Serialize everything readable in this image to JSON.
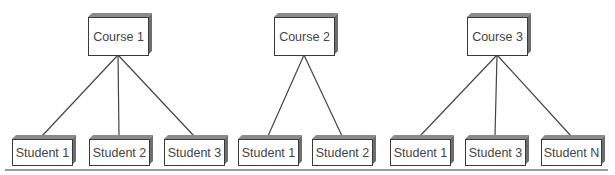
{
  "diagram": {
    "type": "hierarchy",
    "colors": {
      "line": "#444444",
      "box_fill": "#ffffff",
      "box_border": "#3a3a3a",
      "box_shadow": "#6e6e6e",
      "text": "#444444"
    },
    "groups": [
      {
        "course": {
          "label": "Course 1",
          "x": 88,
          "y": 17,
          "w": 60,
          "h": 38
        },
        "students": [
          {
            "label": "Student 1",
            "x": 12,
            "y": 139,
            "w": 60,
            "h": 26
          },
          {
            "label": "Student 2",
            "x": 89,
            "y": 139,
            "w": 60,
            "h": 26
          },
          {
            "label": "Student 3",
            "x": 164,
            "y": 139,
            "w": 60,
            "h": 26
          }
        ]
      },
      {
        "course": {
          "label": "Course 2",
          "x": 274,
          "y": 17,
          "w": 60,
          "h": 38
        },
        "students": [
          {
            "label": "Student 1",
            "x": 238,
            "y": 139,
            "w": 60,
            "h": 26
          },
          {
            "label": "Student 2",
            "x": 312,
            "y": 139,
            "w": 60,
            "h": 26
          }
        ]
      },
      {
        "course": {
          "label": "Course 3",
          "x": 467,
          "y": 17,
          "w": 60,
          "h": 38
        },
        "students": [
          {
            "label": "Student 1",
            "x": 390,
            "y": 139,
            "w": 60,
            "h": 26
          },
          {
            "label": "Student 3",
            "x": 465,
            "y": 139,
            "w": 60,
            "h": 26
          },
          {
            "label": "Student N",
            "x": 541,
            "y": 139,
            "w": 60,
            "h": 26
          }
        ]
      }
    ],
    "baseline": {
      "x1": 5,
      "x2": 608,
      "y": 170
    }
  }
}
